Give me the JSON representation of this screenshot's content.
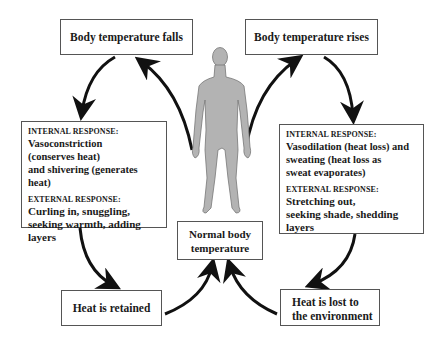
{
  "diagram": {
    "top_left": {
      "label": "Body temperature falls"
    },
    "top_right": {
      "label": "Body temperature rises"
    },
    "left_response": {
      "internal_header": "INTERNAL RESPONSE:",
      "internal_lines": [
        "Vasoconstriction",
        "(conserves heat)",
        "and shivering (generates heat)"
      ],
      "external_header": "EXTERNAL RESPONSE:",
      "external_lines": [
        "Curling in, snuggling,",
        "seeking warmth, adding layers"
      ]
    },
    "right_response": {
      "internal_header": "INTERNAL RESPONSE:",
      "internal_lines": [
        "Vasodilation (heat loss) and",
        "sweating (heat loss as",
        "sweat evaporates)"
      ],
      "external_header": "EXTERNAL RESPONSE:",
      "external_lines": [
        "Stretching out,",
        "seeking shade, shedding layers"
      ]
    },
    "center": {
      "lines": [
        "Normal body",
        "temperature"
      ]
    },
    "bottom_left": {
      "label": "Heat is retained"
    },
    "bottom_right": {
      "lines": [
        "Heat is lost to",
        "the environment"
      ]
    },
    "figure": {
      "icon": "human-body-silhouette-icon",
      "color": "#b3b3b3"
    },
    "arrow_color": "#111111"
  }
}
